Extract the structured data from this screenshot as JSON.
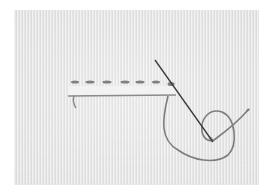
{
  "image": {
    "subject": "embroidery running stitch with needle and thread on white fabric",
    "colors": {
      "fabric": "#e9e9e9",
      "border": "#ffffff",
      "thread": "#7d7d7d",
      "needle": "#3a3a3a",
      "fold_edge": "#f4f4f4"
    },
    "stitches": [
      {
        "x": 71,
        "y": 82,
        "w": 8
      },
      {
        "x": 86,
        "y": 82,
        "w": 9
      },
      {
        "x": 103,
        "y": 82,
        "w": 9
      },
      {
        "x": 121,
        "y": 82,
        "w": 9
      },
      {
        "x": 136,
        "y": 82,
        "w": 9
      },
      {
        "x": 152,
        "y": 82,
        "w": 8
      },
      {
        "x": 168,
        "y": 82,
        "w": 7
      }
    ]
  }
}
